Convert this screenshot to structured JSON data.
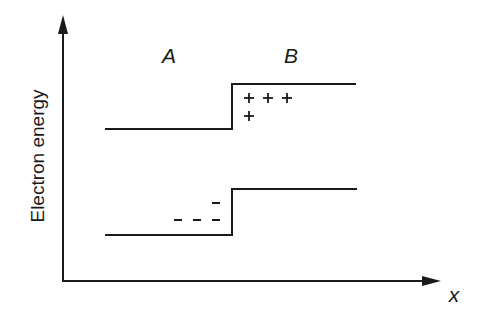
{
  "diagram": {
    "title": "",
    "y_axis_label": "Electron energy",
    "x_axis_label": "x",
    "region_labels": [
      "A",
      "B"
    ],
    "upper_band": {
      "left_y": 129,
      "right_y": 84,
      "x_start": 105,
      "x_step": 232,
      "x_end": 356
    },
    "lower_band": {
      "left_y": 235,
      "right_y": 189,
      "x_start": 105,
      "x_step": 232,
      "x_end": 357
    },
    "charges": {
      "positive_symbol": "+",
      "negative_symbol": "–",
      "positive_count": 4,
      "negative_count": 4,
      "positive_region": "B (above upper band step)",
      "negative_region": "A (above lower band step)"
    },
    "colors": {
      "line": "#1a1a1a",
      "background": "#ffffff"
    }
  }
}
